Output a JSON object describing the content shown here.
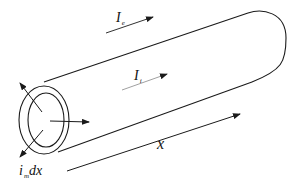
{
  "diagram": {
    "title": "",
    "labels": {
      "extracellular_current": {
        "main": "I",
        "sub": "e"
      },
      "intracellular_current": {
        "main": "I",
        "sub": "i"
      },
      "membrane_current": {
        "main": "i",
        "sub": "m",
        "suffix": "dx"
      },
      "axis": "x"
    },
    "colors": {
      "stroke": "#1a1a1a",
      "background": "#ffffff"
    }
  }
}
